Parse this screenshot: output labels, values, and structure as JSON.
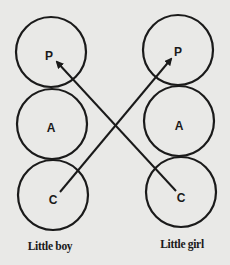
{
  "diagram": {
    "type": "transactional-analysis-ego-states",
    "columns": [
      {
        "label": "Little boy",
        "nodes": [
          {
            "letter": "P"
          },
          {
            "letter": "A"
          },
          {
            "letter": "C"
          }
        ]
      },
      {
        "label": "Little girl",
        "nodes": [
          {
            "letter": "P"
          },
          {
            "letter": "A"
          },
          {
            "letter": "C"
          }
        ]
      }
    ],
    "arrows": [
      {
        "from": "Little boy C",
        "to": "Little girl P"
      },
      {
        "from": "Little girl C",
        "to": "Little boy P"
      }
    ],
    "colors": {
      "background": "#e9e9e7",
      "ink": "#1a1a1a"
    }
  }
}
